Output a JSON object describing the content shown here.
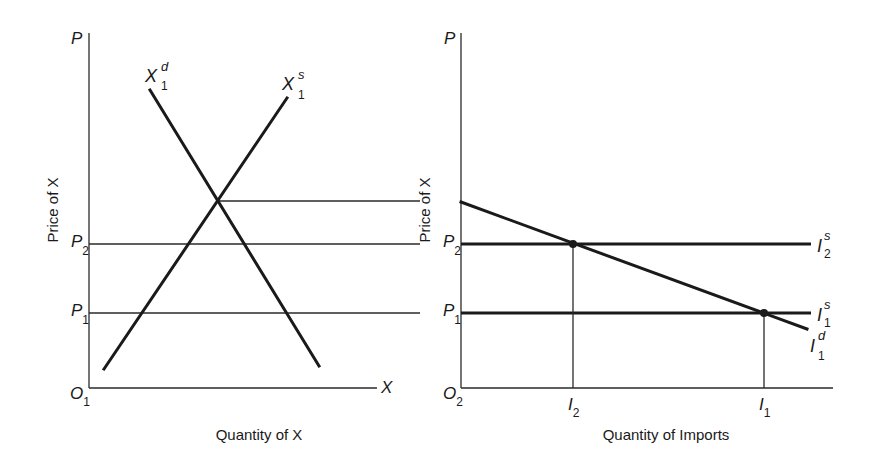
{
  "panels": {
    "left": {
      "y_axis_label": "Price of X",
      "x_axis_label": "Quantity of X",
      "y_axis_end": "P",
      "x_axis_end": "X",
      "origin": {
        "main": "O",
        "sub": "1"
      },
      "price_ticks": [
        {
          "main": "P",
          "sub": "2"
        },
        {
          "main": "P",
          "sub": "1"
        }
      ],
      "curves": {
        "demand": {
          "main": "X",
          "sub": "1",
          "sup": "d"
        },
        "supply": {
          "main": "X",
          "sub": "1",
          "sup": "s"
        }
      }
    },
    "right": {
      "y_axis_label": "Price of X",
      "x_axis_label": "Quantity of Imports",
      "y_axis_end": "P",
      "origin": {
        "main": "O",
        "sub": "2"
      },
      "price_ticks": [
        {
          "main": "P",
          "sub": "2"
        },
        {
          "main": "P",
          "sub": "1"
        }
      ],
      "quantity_ticks": [
        {
          "main": "I",
          "sub": "2"
        },
        {
          "main": "I",
          "sub": "1"
        }
      ],
      "curves": {
        "supply_2": {
          "main": "I",
          "sub": "2",
          "sup": "s"
        },
        "supply_1": {
          "main": "I",
          "sub": "1",
          "sup": "s"
        },
        "demand_1": {
          "main": "I",
          "sub": "1",
          "sup": "d"
        }
      }
    }
  },
  "colors": {
    "ink": "#1a1a1a",
    "background": "#ffffff"
  }
}
